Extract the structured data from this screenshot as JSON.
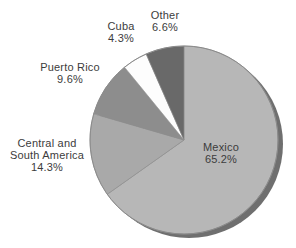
{
  "chart_data": {
    "type": "pie",
    "title": "",
    "direction": "clockwise",
    "start_angle_deg": 0,
    "shadow": true,
    "shadow_color": "#6f6f6f",
    "outline_color": "#8a8a8a",
    "slice_stroke_color": "#909090",
    "label_color": "#3c3c3c",
    "background_color": "#ffffff",
    "segments": [
      {
        "label": "Mexico",
        "value": 65.2,
        "pct_label": "65.2%",
        "color": "#b7b7b7"
      },
      {
        "label": "Central and South America",
        "value": 14.3,
        "pct_label": "14.3%",
        "color": "#a9a9a9"
      },
      {
        "label": "Puerto Rico",
        "value": 9.6,
        "pct_label": "9.6%",
        "color": "#8d8d8d"
      },
      {
        "label": "Cuba",
        "value": 4.3,
        "pct_label": "4.3%",
        "color": "#fdfdfd"
      },
      {
        "label": "Other",
        "value": 6.6,
        "pct_label": "6.6%",
        "color": "#696969"
      }
    ]
  },
  "labels": {
    "mexico": "Mexico\n65.2%",
    "central": "Central and\nSouth America\n14.3%",
    "puerto_rico": "Puerto Rico\n9.6%",
    "cuba": "Cuba\n4.3%",
    "other": "Other\n6.6%"
  }
}
